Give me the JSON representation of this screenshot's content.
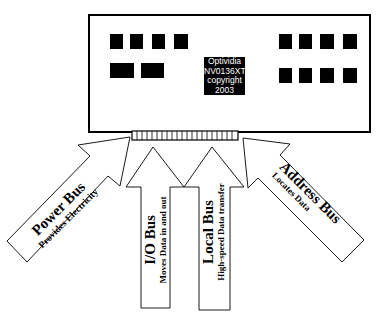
{
  "card": {
    "label_lines": [
      "Optividia",
      "NV0136XT",
      "copyright",
      "2003"
    ]
  },
  "buses": [
    {
      "name": "Power Bus",
      "description": "Provides Electricity"
    },
    {
      "name": "I/O Bus",
      "description": "Moves Data in and out"
    },
    {
      "name": "Local Bus",
      "description": "High-speed Data transfer"
    },
    {
      "name": "Address Bus",
      "description": "Locates Data"
    }
  ],
  "colors": {
    "stroke": "#000000",
    "fill": "#ffffff",
    "chip": "#000000"
  }
}
